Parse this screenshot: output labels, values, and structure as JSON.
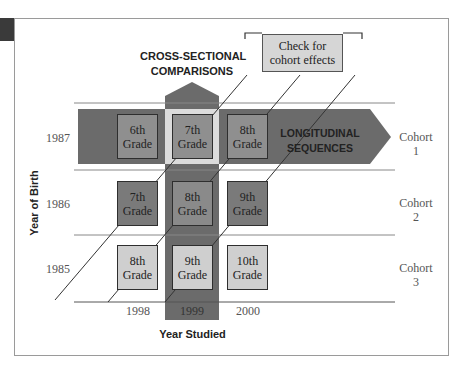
{
  "diagram": {
    "type": "cross-sequential research design",
    "callout": {
      "line1": "Check for",
      "line2": "cohort effects"
    },
    "cross_sectional_label": {
      "line1": "CROSS-SECTIONAL",
      "line2": "COMPARISONS"
    },
    "longitudinal_label": {
      "line1": "LONGITUDINAL",
      "line2": "SEQUENCES"
    },
    "y_axis_title": "Year of Birth",
    "x_axis_title": "Year Studied",
    "birth_years": [
      "1987",
      "1986",
      "1985"
    ],
    "study_years": [
      "1998",
      "1999",
      "2000"
    ],
    "cohorts": [
      {
        "line1": "Cohort",
        "line2": "1"
      },
      {
        "line1": "Cohort",
        "line2": "2"
      },
      {
        "line1": "Cohort",
        "line2": "3"
      }
    ],
    "grid": [
      [
        {
          "n": "6th",
          "g": "Grade"
        },
        {
          "n": "7th",
          "g": "Grade"
        },
        {
          "n": "8th",
          "g": "Grade"
        }
      ],
      [
        {
          "n": "7th",
          "g": "Grade"
        },
        {
          "n": "8th",
          "g": "Grade"
        },
        {
          "n": "9th",
          "g": "Grade"
        }
      ],
      [
        {
          "n": "8th",
          "g": "Grade"
        },
        {
          "n": "9th",
          "g": "Grade"
        },
        {
          "n": "10th",
          "g": "Grade"
        }
      ]
    ],
    "colors": {
      "dark_band": "#6b6b6b",
      "row1_box": "#8f8f8f",
      "row2_box": "#7a7a7a",
      "row3_box": "#cfcfcf",
      "crossing_light": "#dcdcdc",
      "callout_fill": "#d6d6d6"
    }
  }
}
